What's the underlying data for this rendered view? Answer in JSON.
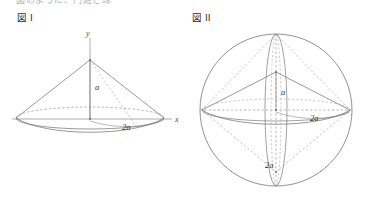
{
  "page": {
    "background_color": "#ffffff",
    "stroke_color": "#6f6f6f",
    "dash_color": "#8c8c8c",
    "text_color": "#333333",
    "width": 367,
    "height": 202,
    "cutoff_top_text": "図のように、円錐と球"
  },
  "figures": [
    {
      "id": "figure-1",
      "caption": "図 I",
      "shape": "cone",
      "description": "Right circular cone with apex on the y-axis and circular base centred on the origin, drawn in oblique projection.",
      "axes": {
        "vertical_label": "y",
        "horizontal_label": "x"
      },
      "dimensions": [
        {
          "name": "height",
          "label": "a",
          "position": "apex-to-origin"
        },
        {
          "name": "base_radius",
          "label": "2a",
          "position": "origin-to-right-rim"
        }
      ]
    },
    {
      "id": "figure-2",
      "caption": "図 II",
      "shape": "sphere-with-bicone",
      "description": "Sphere circumscribing a double cone (bicone) formed by rotating the figure I cone about the x-axis; construction lines dashed.",
      "dimensions": [
        {
          "name": "half_height",
          "label": "a",
          "position": "centre-to-upper-apex"
        },
        {
          "name": "radius",
          "label": "2a",
          "position": "centre-to-right-rim"
        },
        {
          "name": "lower_extent",
          "label": "2a",
          "position": "centre-to-lower-apex"
        }
      ]
    }
  ]
}
